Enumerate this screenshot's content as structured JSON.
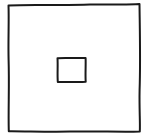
{
  "diagram": {
    "style": "hand-drawn sketch",
    "background": "#ffffff",
    "stroke_color": "#1a1a1a",
    "shapes": [
      {
        "id": "outer-square",
        "type": "rectangle",
        "x": 8,
        "y": 4,
        "width": 132,
        "height": 128
      },
      {
        "id": "inner-rectangle",
        "type": "rectangle",
        "x": 57,
        "y": 58,
        "width": 29,
        "height": 24
      }
    ]
  }
}
